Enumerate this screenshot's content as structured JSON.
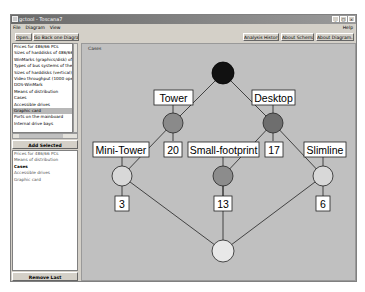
{
  "window": {
    "title": "gctool - Toscana7",
    "controls": [
      "minimize",
      "maximize",
      "close"
    ]
  },
  "menu": {
    "items": [
      "File",
      "Diagram",
      "View"
    ],
    "help": "Help"
  },
  "toolbar": {
    "open": "Open...",
    "go_back": "Go Back one Diagram",
    "analysis_history": "Analysis History...",
    "about_schema": "About Schema...",
    "about_diagram": "About Diagram..."
  },
  "left_panel": {
    "attributes": [
      "Prices for 486/66 PCs",
      "Sizes of harddisks of 486/66 PCs",
      "WinMarks (graphics/disk) of 486",
      "Types of bus systems of the 486",
      "Sizes of harddisks (vertical)",
      "Video throughput (1000 operations)",
      "DOS-WinMark",
      "Means of distribution",
      "Cases",
      "Accessible drives",
      "Graphic card",
      "Ports on the mainboard",
      "Internal drive bays"
    ],
    "selected_index": 10,
    "add_button": "Add Selected",
    "selected_list": [
      "Prices for 486/66 PCs",
      "Means of distribution",
      "Cases",
      "Accessible drives",
      "Graphic card"
    ],
    "selected_bold_index": 2,
    "remove_button": "Remove Last"
  },
  "diagram": {
    "title": "Cases",
    "colors": {
      "background": "#c0c0c0",
      "top": "#111111",
      "level1_left": "#8a8a8a",
      "level1_right": "#6e6e6e",
      "level2_light": "#d8d8d8",
      "level2_mid": "#8c8c8c",
      "bottom": "#e8e8e8"
    },
    "labels": {
      "tower": "Tower",
      "desktop": "Desktop",
      "mini_tower": "Mini-Tower",
      "small_footprint": "Small-footprint",
      "slimline": "Slimline"
    },
    "counts": {
      "tower": "20",
      "desktop": "17",
      "mini_tower": "3",
      "small_footprint": "13",
      "slimline": "6"
    }
  }
}
